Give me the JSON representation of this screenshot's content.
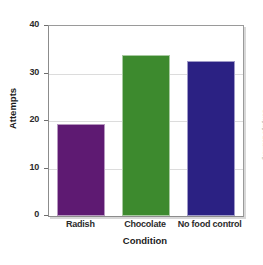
{
  "chart_data": {
    "type": "bar",
    "title": "",
    "subtitle": "",
    "xlabel": "Condition",
    "ylabel": "Attempts",
    "categories": [
      "Radish",
      "Chocolate",
      "No food control"
    ],
    "values": [
      19.3,
      34.0,
      32.6
    ],
    "series": [
      {
        "name": "Attempts",
        "values": [
          19.3,
          34.0,
          32.6
        ]
      }
    ],
    "colors": [
      "#5E1A72",
      "#3D8A2E",
      "#2B2183"
    ],
    "ylim": [
      0,
      40
    ],
    "yticks": [
      0,
      10,
      20,
      30,
      40
    ],
    "ytick_labels": [
      "0",
      "10",
      "20",
      "30",
      "40"
    ],
    "grid": true,
    "grid_axis": "y",
    "legend": false,
    "legend_position": "none",
    "annotations": []
  },
  "credit": {
    "text": "© Cengage Learning"
  },
  "style": {
    "background": "#ffffff",
    "grid_color": "#dcdcdc",
    "axis_color": "#8c8c8c",
    "text_color": "#2b2b2b"
  }
}
